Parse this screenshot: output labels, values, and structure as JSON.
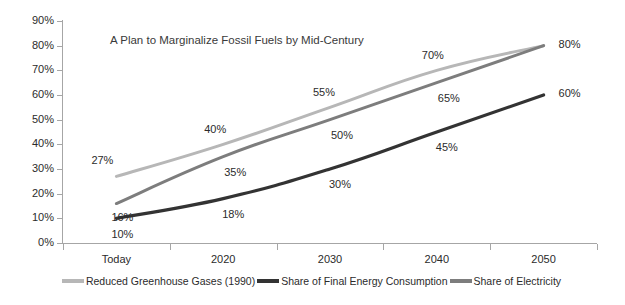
{
  "chart_data": {
    "type": "line",
    "title": "A Plan to Marginalize Fossil Fuels by Mid-Century",
    "xlabel": "",
    "ylabel": "",
    "categories": [
      "Today",
      "2020",
      "2030",
      "2040",
      "2050"
    ],
    "ylim": [
      0,
      90
    ],
    "ytick_labels": [
      "0%",
      "10%",
      "20%",
      "30%",
      "40%",
      "50%",
      "60%",
      "70%",
      "80%",
      "90%"
    ],
    "ytick_values": [
      0,
      10,
      20,
      30,
      40,
      50,
      60,
      70,
      80,
      90
    ],
    "grid": false,
    "legend_position": "bottom",
    "series": [
      {
        "name": "Reduced Greenhouse Gases (1990)",
        "color": "#b7b7b7",
        "values": [
          27,
          40,
          55,
          70,
          80
        ],
        "labels": [
          "27%",
          "40%",
          "55%",
          "70%",
          "80%"
        ]
      },
      {
        "name": "Share of Final Energy Consumption",
        "color": "#333333",
        "values": [
          10,
          18,
          30,
          45,
          60
        ],
        "labels": [
          "10%",
          "18%",
          "30%",
          "45%",
          "60%"
        ]
      },
      {
        "name": "Share of Electricity",
        "color": "#7d7d7d",
        "values": [
          16,
          35,
          50,
          65,
          80
        ],
        "labels": [
          "16%",
          "35%",
          "50%",
          "65%",
          "80%"
        ]
      }
    ]
  },
  "colors": {
    "axis": "#a6a6a6",
    "text": "#2b2b2b",
    "background": "#ffffff",
    "series_light_gray": "#b7b7b7",
    "series_dark": "#333333",
    "series_mid_gray": "#7d7d7d"
  }
}
